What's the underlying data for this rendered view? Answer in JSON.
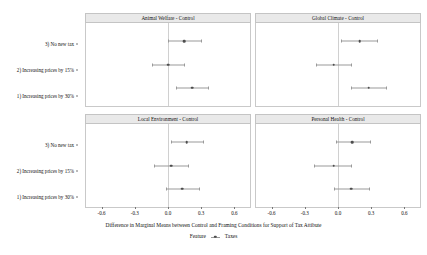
{
  "chart_data": {
    "type": "scatter",
    "title": "",
    "xlabel": "Difference in Marginal Means between Control and Framing Conditions for Support of Tax Attibute",
    "ylabel": "",
    "xlim": [
      -0.75,
      0.75
    ],
    "xticks": [
      -0.6,
      -0.3,
      0.0,
      0.3,
      0.6
    ],
    "xticklabels": [
      "-0.6",
      "-0.3",
      "0.0",
      "0.3",
      "0.6"
    ],
    "categories": [
      "3) No new tax",
      "2) Increasing prices by 15%",
      "1) Increasing prices by 30%"
    ],
    "grid": false,
    "reference_line": 0.0,
    "legend": {
      "position": "bottom",
      "title": "Feature",
      "separator": "-",
      "entries": [
        "Taxes"
      ]
    },
    "facets": [
      {
        "label": "Animal Welfare - Control",
        "row": 0,
        "col": 0,
        "points": [
          {
            "category": "3) No new tax",
            "estimate": 0.15,
            "low": 0.0,
            "high": 0.3
          },
          {
            "category": "2) Increasing prices by 15%",
            "estimate": 0.0,
            "low": -0.15,
            "high": 0.15
          },
          {
            "category": "1) Increasing prices by 30%",
            "estimate": 0.22,
            "low": 0.07,
            "high": 0.37
          }
        ]
      },
      {
        "label": "Global Climate - Control",
        "row": 0,
        "col": 1,
        "points": [
          {
            "category": "3) No new tax",
            "estimate": 0.2,
            "low": 0.03,
            "high": 0.36
          },
          {
            "category": "2) Increasing prices by 15%",
            "estimate": -0.04,
            "low": -0.2,
            "high": 0.12
          },
          {
            "category": "1) Increasing prices by 30%",
            "estimate": 0.28,
            "low": 0.12,
            "high": 0.44
          }
        ]
      },
      {
        "label": "Local Environment - Control",
        "row": 1,
        "col": 0,
        "points": [
          {
            "category": "3) No new tax",
            "estimate": 0.17,
            "low": 0.03,
            "high": 0.32
          },
          {
            "category": "2) Increasing prices by 15%",
            "estimate": 0.03,
            "low": -0.13,
            "high": 0.18
          },
          {
            "category": "1) Increasing prices by 30%",
            "estimate": 0.13,
            "low": -0.02,
            "high": 0.28
          }
        ]
      },
      {
        "label": "Personal Health - Control",
        "row": 1,
        "col": 1,
        "points": [
          {
            "category": "3) No new tax",
            "estimate": 0.13,
            "low": -0.02,
            "high": 0.29
          },
          {
            "category": "2) Increasing prices by 15%",
            "estimate": -0.04,
            "low": -0.22,
            "high": 0.12
          },
          {
            "category": "1) Increasing prices by 30%",
            "estimate": 0.12,
            "low": -0.04,
            "high": 0.28
          }
        ]
      }
    ]
  },
  "layout": {
    "panel_geometry": [
      {
        "left": 85,
        "top": 13,
        "width": 166,
        "height": 94
      },
      {
        "left": 255,
        "top": 13,
        "width": 166,
        "height": 94
      },
      {
        "left": 85,
        "top": 114,
        "width": 166,
        "height": 94
      },
      {
        "left": 255,
        "top": 114,
        "width": 166,
        "height": 94
      }
    ],
    "row_offsets_pct": [
      22,
      50,
      78
    ]
  }
}
